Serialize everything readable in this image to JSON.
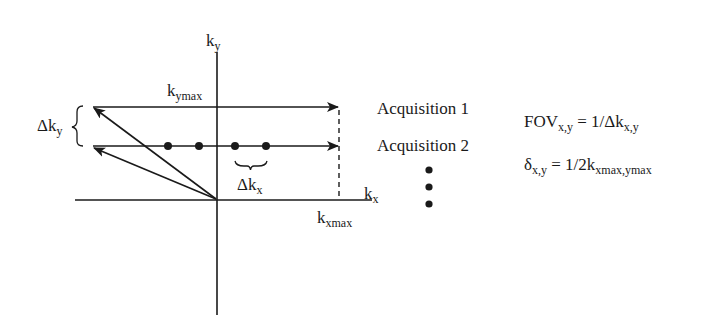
{
  "diagram": {
    "axes": {
      "ky": {
        "base": "k",
        "sub": "y"
      },
      "kx": {
        "base": "k",
        "sub": "x"
      }
    },
    "labels": {
      "kymax": {
        "base": "k",
        "sub": "ymax"
      },
      "kxmax": {
        "base": "k",
        "sub": "xmax"
      },
      "delta_ky": {
        "base": "Δk",
        "sub": "y"
      },
      "delta_kx": {
        "base": "Δk",
        "sub": "x"
      }
    },
    "acquisitions": [
      "Acquisition 1",
      "Acquisition 2"
    ],
    "ellipsis_dots": 3,
    "equations": [
      {
        "lhs_base": "FOV",
        "lhs_sub": "x,y",
        "rhs_base": " = 1/Δk",
        "rhs_sub": "x,y"
      },
      {
        "lhs_base": "δ",
        "lhs_sub": "x,y",
        "rhs_base": " = 1/2k",
        "rhs_sub": "xmax,ymax"
      }
    ],
    "sample_points": 4,
    "colors": {
      "line": "#1a1a1a",
      "background": "#ffffff"
    }
  }
}
